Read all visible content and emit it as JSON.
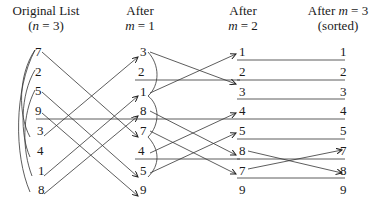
{
  "headers": {
    "col1_line1": "Original List",
    "col1_line2_prefix": "(",
    "col1_var": "n",
    "col1_line2_suffix": " = 3)",
    "col2_line1": "After",
    "col2_var": "m",
    "col2_line2_suffix": " = 1",
    "col3_line1": "After",
    "col3_var": "m",
    "col3_line2_suffix": " = 2",
    "col4_line1_prefix": "After ",
    "col4_var": "m",
    "col4_line1_suffix": " = 3",
    "col4_line2": "(sorted)"
  },
  "columns": {
    "original": [
      "7",
      "2",
      "5",
      "9",
      "3",
      "4",
      "1",
      "8"
    ],
    "after_m1": [
      "3",
      "2",
      "1",
      "8",
      "7",
      "4",
      "5",
      "9"
    ],
    "after_m2": [
      "1",
      "2",
      "3",
      "4",
      "5",
      "8",
      "7",
      "9"
    ],
    "sorted": [
      "1",
      "2",
      "3",
      "4",
      "5",
      "7",
      "8",
      "9"
    ]
  }
}
